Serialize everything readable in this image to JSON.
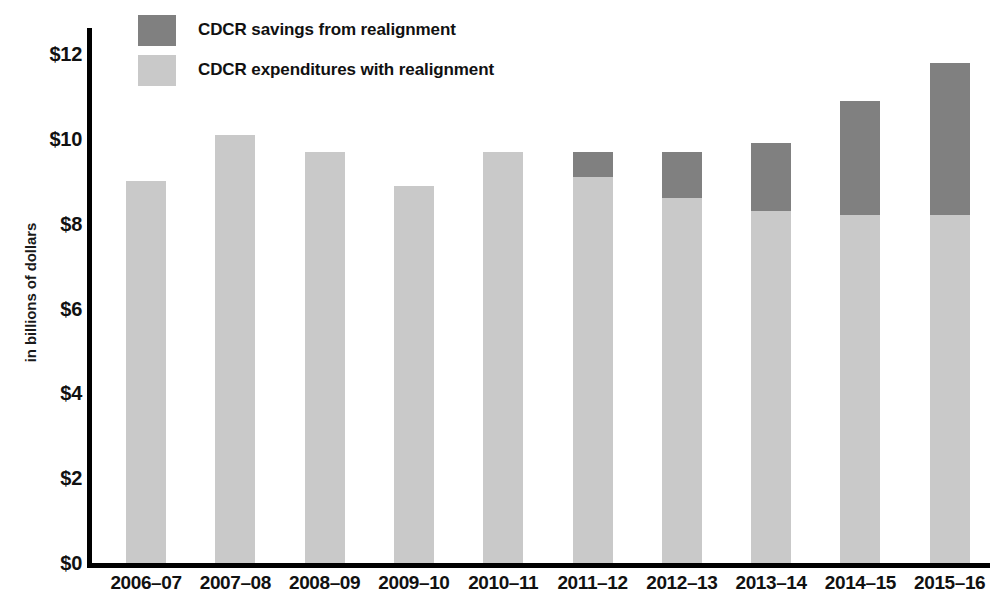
{
  "chart_data": {
    "type": "bar",
    "stacked": true,
    "title": "",
    "xlabel": "",
    "ylabel": "in billions of dollars",
    "ylim": [
      0,
      12
    ],
    "yticks": [
      "$0",
      "$2",
      "$4",
      "$6",
      "$8",
      "$10",
      "$12"
    ],
    "ytick_values": [
      0,
      2,
      4,
      6,
      8,
      10,
      12
    ],
    "grid": false,
    "legend_position": "top-left",
    "categories": [
      "2006–07",
      "2007–08",
      "2008–09",
      "2009–10",
      "2010–11",
      "2011–12",
      "2012–13",
      "2013–14",
      "2014–15",
      "2015–16"
    ],
    "series": [
      {
        "name": "CDCR expenditures with realignment",
        "color": "#c9c9c9",
        "values": [
          9.0,
          10.1,
          9.7,
          8.9,
          9.7,
          9.1,
          8.6,
          8.3,
          8.2,
          8.2
        ]
      },
      {
        "name": "CDCR savings from realignment",
        "color": "#808080",
        "values": [
          0,
          0,
          0,
          0,
          0,
          0.6,
          1.1,
          1.6,
          2.7,
          3.6
        ]
      }
    ],
    "totals": [
      9.0,
      10.1,
      9.7,
      8.9,
      9.7,
      9.7,
      9.7,
      9.9,
      10.9,
      11.8
    ]
  },
  "legend": {
    "items": [
      {
        "label": "CDCR savings from realignment",
        "swatch": "savings"
      },
      {
        "label": "CDCR expenditures with realignment",
        "swatch": "expenditures"
      }
    ]
  },
  "axis": {
    "y_title": "in billions of dollars"
  }
}
